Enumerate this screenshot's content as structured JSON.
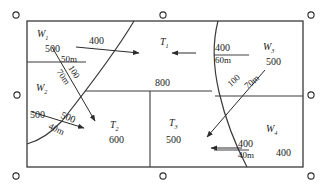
{
  "figure": {
    "line_color": "#333333",
    "text_color": "#1a1a1a",
    "background": "#ffffff"
  },
  "zones": [
    {
      "name": "W1",
      "label": "W",
      "subscript": "1"
    },
    {
      "name": "W2",
      "label": "W",
      "subscript": "2"
    },
    {
      "name": "W3",
      "label": "W",
      "subscript": "3"
    },
    {
      "name": "W4",
      "label": "W",
      "subscript": "4"
    },
    {
      "name": "T1",
      "label": "T",
      "subscript": "1",
      "value": "800"
    },
    {
      "name": "T2",
      "label": "T",
      "subscript": "2",
      "value": "600"
    },
    {
      "name": "T3",
      "label": "T",
      "subscript": "3",
      "value": "500"
    }
  ],
  "annotations": {
    "w1_quantity": "500",
    "w1_flow": "400",
    "w1_distance": "50m",
    "w2_quantity_a": "100",
    "w2_distance_a": "70m",
    "w2_quantity_b": "500",
    "w2_flow": "500",
    "w2_distance_b": "40m",
    "t1_value": "800",
    "t2_value": "600",
    "t3_value": "500",
    "w3_flow": "400",
    "w3_distance": "60m",
    "w3_quantity": "500",
    "w3_quantity_b": "100",
    "w3_distance_b": "70m",
    "w4_flow": "400",
    "w4_distance": "40m",
    "w4_quantity": "400"
  },
  "markers": {
    "name": "corner-registration-circle",
    "count": 6
  }
}
